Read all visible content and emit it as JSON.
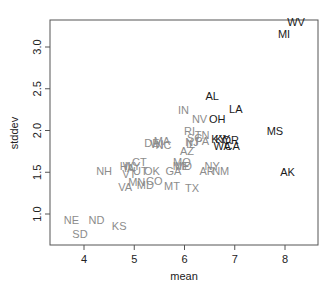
{
  "chart_data": {
    "type": "scatter",
    "title": "",
    "xlabel": "mean",
    "ylabel": "stddev",
    "xlim": [
      3.45,
      8.35
    ],
    "ylim": [
      0.68,
      3.38
    ],
    "xticks": [
      4,
      5,
      6,
      7,
      8
    ],
    "yticks": [
      1.0,
      1.5,
      2.0,
      2.5,
      3.0
    ],
    "ytick_labels": [
      "1.0",
      "1.5",
      "2.0",
      "2.5",
      "3.0"
    ],
    "grid": false,
    "legend": null,
    "marker": "text-label",
    "colors": {
      "dark": "#1a1a1a",
      "light": "#8c8c8c",
      "axis": "#555555"
    },
    "points": [
      {
        "label": "WV",
        "x": 8.22,
        "y": 3.3,
        "shade": "dark"
      },
      {
        "label": "MI",
        "x": 7.98,
        "y": 3.16,
        "shade": "dark"
      },
      {
        "label": "AL",
        "x": 6.55,
        "y": 2.41,
        "shade": "dark"
      },
      {
        "label": "LA",
        "x": 7.02,
        "y": 2.26,
        "shade": "dark"
      },
      {
        "label": "IN",
        "x": 5.98,
        "y": 2.25,
        "shade": "light"
      },
      {
        "label": "NV",
        "x": 6.3,
        "y": 2.14,
        "shade": "light"
      },
      {
        "label": "OH",
        "x": 6.65,
        "y": 2.14,
        "shade": "dark"
      },
      {
        "label": "MS",
        "x": 7.8,
        "y": 1.99,
        "shade": "dark"
      },
      {
        "label": "RI",
        "x": 6.1,
        "y": 2.0,
        "shade": "light"
      },
      {
        "label": "TN",
        "x": 6.35,
        "y": 1.95,
        "shade": "light"
      },
      {
        "label": "SC",
        "x": 6.2,
        "y": 1.91,
        "shade": "light"
      },
      {
        "label": "PA",
        "x": 6.35,
        "y": 1.87,
        "shade": "light"
      },
      {
        "label": "KY",
        "x": 6.68,
        "y": 1.9,
        "shade": "dark"
      },
      {
        "label": "KY2",
        "x": 6.76,
        "y": 1.9,
        "shade": "dark"
      },
      {
        "label": "OR",
        "x": 6.92,
        "y": 1.89,
        "shade": "dark"
      },
      {
        "label": "WA",
        "x": 6.75,
        "y": 1.82,
        "shade": "dark"
      },
      {
        "label": "CA",
        "x": 6.95,
        "y": 1.82,
        "shade": "dark"
      },
      {
        "label": "IL",
        "x": 6.12,
        "y": 1.84,
        "shade": "light"
      },
      {
        "label": "NJ",
        "x": 6.15,
        "y": 1.86,
        "shade": "light"
      },
      {
        "label": "AZ",
        "x": 6.05,
        "y": 1.76,
        "shade": "light"
      },
      {
        "label": "DE",
        "x": 5.35,
        "y": 1.85,
        "shade": "light"
      },
      {
        "label": "MA",
        "x": 5.55,
        "y": 1.88,
        "shade": "light"
      },
      {
        "label": "WI",
        "x": 5.45,
        "y": 1.84,
        "shade": "light"
      },
      {
        "label": "NC",
        "x": 5.58,
        "y": 1.83,
        "shade": "light"
      },
      {
        "label": "MO",
        "x": 5.95,
        "y": 1.62,
        "shade": "light"
      },
      {
        "label": "ME",
        "x": 5.93,
        "y": 1.58,
        "shade": "light"
      },
      {
        "label": "MD2",
        "x": 5.98,
        "y": 1.57,
        "shade": "light"
      },
      {
        "label": "NY",
        "x": 6.55,
        "y": 1.57,
        "shade": "light"
      },
      {
        "label": "AR",
        "x": 6.45,
        "y": 1.51,
        "shade": "light"
      },
      {
        "label": "NM",
        "x": 6.72,
        "y": 1.51,
        "shade": "light"
      },
      {
        "label": "AK",
        "x": 8.05,
        "y": 1.5,
        "shade": "dark"
      },
      {
        "label": "GA",
        "x": 5.78,
        "y": 1.51,
        "shade": "light"
      },
      {
        "label": "CT",
        "x": 5.1,
        "y": 1.62,
        "shade": "light"
      },
      {
        "label": "HI",
        "x": 4.82,
        "y": 1.57,
        "shade": "light"
      },
      {
        "label": "WY",
        "x": 4.95,
        "y": 1.57,
        "shade": "light"
      },
      {
        "label": "IA",
        "x": 4.9,
        "y": 1.55,
        "shade": "light"
      },
      {
        "label": "UT",
        "x": 5.12,
        "y": 1.52,
        "shade": "light"
      },
      {
        "label": "OK",
        "x": 5.35,
        "y": 1.51,
        "shade": "light"
      },
      {
        "label": "VT",
        "x": 4.9,
        "y": 1.48,
        "shade": "light"
      },
      {
        "label": "NH",
        "x": 4.4,
        "y": 1.52,
        "shade": "light"
      },
      {
        "label": "CO",
        "x": 5.4,
        "y": 1.4,
        "shade": "light"
      },
      {
        "label": "MN",
        "x": 5.05,
        "y": 1.38,
        "shade": "light"
      },
      {
        "label": "MD",
        "x": 5.22,
        "y": 1.35,
        "shade": "light"
      },
      {
        "label": "MT",
        "x": 5.75,
        "y": 1.34,
        "shade": "light"
      },
      {
        "label": "TX",
        "x": 6.15,
        "y": 1.31,
        "shade": "light"
      },
      {
        "label": "VA",
        "x": 4.82,
        "y": 1.32,
        "shade": "light"
      },
      {
        "label": "NE",
        "x": 3.75,
        "y": 0.93,
        "shade": "light"
      },
      {
        "label": "ND",
        "x": 4.25,
        "y": 0.93,
        "shade": "light"
      },
      {
        "label": "KS",
        "x": 4.7,
        "y": 0.86,
        "shade": "light"
      },
      {
        "label": "SD",
        "x": 3.92,
        "y": 0.76,
        "shade": "light"
      }
    ]
  }
}
